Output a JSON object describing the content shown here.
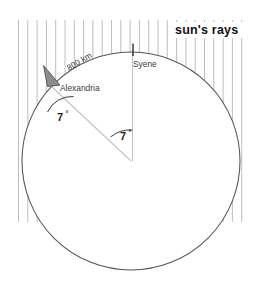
{
  "diagram": {
    "title_text": "sun's rays",
    "labels": {
      "sun_rays": "sun's rays",
      "syene": "Syene",
      "alexandria": "Alexandria",
      "distance": "800 km",
      "angle_alexandria": "7",
      "angle_alexandria_degree": "°",
      "angle_center": "7",
      "angle_center_degree": "°"
    },
    "colors": {
      "background": "#ffffff",
      "earth_circle": "#4a4a4a",
      "sun_ray": "#b0b0b0",
      "obelisk_shadow_fill": "#8c8c8c",
      "obelisk_shadow_stroke": "#4f4f4f",
      "radius_line": "#bdbdbd",
      "gnomon": "#2b2b2b",
      "angle_arc": "#3a3a3a",
      "text": "#2e2e2e"
    },
    "geometry": {
      "circle_center_x": 131,
      "circle_center_y": 161,
      "circle_radius": 109,
      "syene_x": 133,
      "syene_top_y": 52,
      "alexandria_x": 58,
      "alexandria_y": 85,
      "rays_left_x": 18,
      "rays_right_x": 245,
      "rays_top_y": 20,
      "rays_bottom_y": 222,
      "ray_spacing": 9.3,
      "angle_degrees": 7
    }
  }
}
